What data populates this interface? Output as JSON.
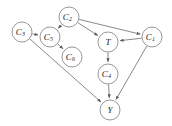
{
  "figure": {
    "kind": "causal-dag",
    "background_color": "#ffffff",
    "node_fill_color": "#ffffff",
    "node_stroke_color": "#8c8c8c",
    "edge_color": "#6b6b6b",
    "label_color": "#1a1a1a",
    "width": 172,
    "height": 126
  },
  "nodes": [
    {
      "id": "C3",
      "base": "C",
      "sub": "3",
      "cx": 22,
      "cy": 32,
      "r": 10
    },
    {
      "id": "C5",
      "base": "C",
      "sub": "5",
      "cx": 50,
      "cy": 37,
      "r": 10
    },
    {
      "id": "C2",
      "base": "C",
      "sub": "2",
      "cx": 69,
      "cy": 17,
      "r": 10
    },
    {
      "id": "C6",
      "base": "C",
      "sub": "6",
      "cx": 72,
      "cy": 57,
      "r": 10
    },
    {
      "id": "T",
      "base": "T",
      "sub": "",
      "cx": 108,
      "cy": 42,
      "r": 10
    },
    {
      "id": "C1",
      "base": "C",
      "sub": "1",
      "cx": 152,
      "cy": 37,
      "r": 10
    },
    {
      "id": "C4",
      "base": "C",
      "sub": "4",
      "cx": 108,
      "cy": 74,
      "r": 10
    },
    {
      "id": "Y",
      "base": "Y",
      "sub": "",
      "cx": 110,
      "cy": 110,
      "r": 10
    }
  ],
  "edges": [
    {
      "id": "C3-C5",
      "from": "C3",
      "to": "C5",
      "directed": true
    },
    {
      "id": "C2-C5",
      "from": "C2",
      "to": "C5",
      "directed": true
    },
    {
      "id": "C2-T",
      "from": "C2",
      "to": "T",
      "directed": true
    },
    {
      "id": "C2-C1",
      "from": "C2",
      "to": "C1",
      "directed": true
    },
    {
      "id": "C5-C6",
      "from": "C5",
      "to": "C6",
      "directed": true
    },
    {
      "id": "C1-T",
      "from": "C1",
      "to": "T",
      "directed": true
    },
    {
      "id": "T-C4",
      "from": "T",
      "to": "C4",
      "directed": true
    },
    {
      "id": "C4-Y",
      "from": "C4",
      "to": "Y",
      "directed": true
    },
    {
      "id": "C3-Y",
      "from": "C3",
      "to": "Y",
      "directed": true
    },
    {
      "id": "C1-Y",
      "from": "C1",
      "to": "Y",
      "directed": true
    }
  ]
}
